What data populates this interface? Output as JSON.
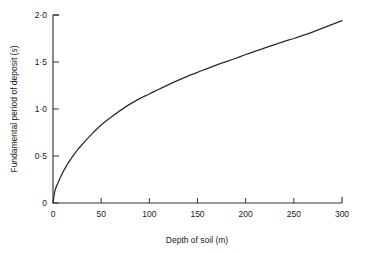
{
  "chart_data": {
    "type": "line",
    "title": "",
    "xlabel": "Depth of soil (m)",
    "ylabel": "Fundamental period of deposit (s)",
    "ylabel_plain": "Fundamental period of deposit (",
    "ylabel_unit_italic": "s",
    "ylabel_tail": ")",
    "xlim": [
      0,
      300
    ],
    "ylim": [
      0,
      2.0
    ],
    "grid": false,
    "legend": null,
    "x_ticks": [
      0,
      50,
      100,
      150,
      200,
      250,
      300
    ],
    "x_tick_labels": [
      "0",
      "50",
      "100",
      "150",
      "200",
      "250",
      "300"
    ],
    "y_ticks": [
      0,
      0.5,
      1.0,
      1.5,
      2.0
    ],
    "y_tick_labels": [
      "0",
      "0·5",
      "1·0",
      "1·5",
      "2·0"
    ],
    "series": [
      {
        "name": "Fundamental period vs depth",
        "color": "#2b2b2b",
        "x": [
          0,
          2,
          5,
          8,
          12,
          16,
          20,
          25,
          30,
          40,
          50,
          60,
          75,
          90,
          100,
          120,
          140,
          150,
          170,
          190,
          200,
          220,
          240,
          250,
          270,
          290,
          300
        ],
        "y": [
          0.0,
          0.13,
          0.21,
          0.28,
          0.36,
          0.43,
          0.49,
          0.56,
          0.62,
          0.73,
          0.83,
          0.91,
          1.02,
          1.11,
          1.16,
          1.26,
          1.35,
          1.39,
          1.47,
          1.54,
          1.58,
          1.65,
          1.72,
          1.75,
          1.82,
          1.9,
          1.94
        ]
      }
    ]
  },
  "figure": {
    "background_color": "#ffffff",
    "axis_color": "#333333",
    "text_color": "#1a1a1a"
  }
}
